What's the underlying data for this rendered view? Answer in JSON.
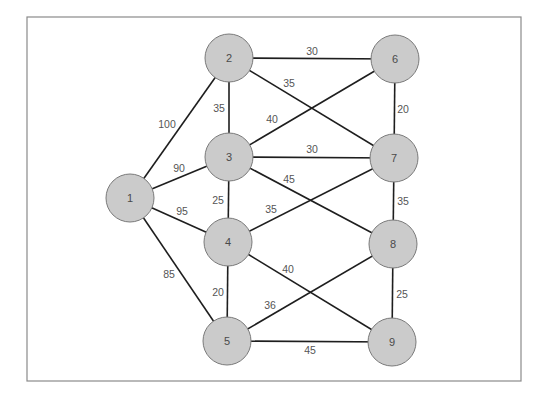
{
  "diagram": {
    "type": "weighted-undirected-graph",
    "colors": {
      "node_fill": "#cbcbcb",
      "node_stroke": "#7a7a7a",
      "edge": "#1e1e1e",
      "label": "#555555",
      "frame": "#8a8a8a"
    },
    "frame": {
      "x": 27,
      "y": 17,
      "w": 494,
      "h": 364
    },
    "nodes": [
      {
        "id": "1",
        "label": "1",
        "x": 130,
        "y": 198
      },
      {
        "id": "2",
        "label": "2",
        "x": 229,
        "y": 58
      },
      {
        "id": "3",
        "label": "3",
        "x": 229,
        "y": 157
      },
      {
        "id": "4",
        "label": "4",
        "x": 228,
        "y": 242
      },
      {
        "id": "5",
        "label": "5",
        "x": 227,
        "y": 341
      },
      {
        "id": "6",
        "label": "6",
        "x": 395,
        "y": 59
      },
      {
        "id": "7",
        "label": "7",
        "x": 394,
        "y": 158
      },
      {
        "id": "8",
        "label": "8",
        "x": 393,
        "y": 244
      },
      {
        "id": "9",
        "label": "9",
        "x": 392,
        "y": 342
      }
    ],
    "node_radius": 24,
    "edges": [
      {
        "from": "1",
        "to": "2",
        "weight": "100",
        "lx": 167,
        "ly": 124
      },
      {
        "from": "1",
        "to": "3",
        "weight": "90",
        "lx": 179,
        "ly": 168
      },
      {
        "from": "1",
        "to": "4",
        "weight": "95",
        "lx": 182,
        "ly": 211
      },
      {
        "from": "1",
        "to": "5",
        "weight": "85",
        "lx": 169,
        "ly": 274
      },
      {
        "from": "2",
        "to": "3",
        "weight": "35",
        "lx": 219,
        "ly": 108
      },
      {
        "from": "2",
        "to": "6",
        "weight": "30",
        "lx": 312,
        "ly": 51
      },
      {
        "from": "2",
        "to": "7",
        "weight": "35",
        "lx": 289,
        "ly": 83
      },
      {
        "from": "3",
        "to": "6",
        "weight": "40",
        "lx": 272,
        "ly": 119
      },
      {
        "from": "3",
        "to": "7",
        "weight": "30",
        "lx": 312,
        "ly": 149
      },
      {
        "from": "3",
        "to": "8",
        "weight": "45",
        "lx": 289,
        "ly": 179
      },
      {
        "from": "3",
        "to": "4",
        "weight": "25",
        "lx": 218,
        "ly": 200
      },
      {
        "from": "4",
        "to": "7",
        "weight": "35",
        "lx": 271,
        "ly": 209
      },
      {
        "from": "4",
        "to": "9",
        "weight": "40",
        "lx": 288,
        "ly": 269
      },
      {
        "from": "4",
        "to": "5",
        "weight": "20",
        "lx": 218,
        "ly": 292
      },
      {
        "from": "5",
        "to": "8",
        "weight": "36",
        "lx": 270,
        "ly": 305
      },
      {
        "from": "5",
        "to": "9",
        "weight": "45",
        "lx": 310,
        "ly": 350
      },
      {
        "from": "6",
        "to": "7",
        "weight": "20",
        "lx": 403,
        "ly": 109
      },
      {
        "from": "7",
        "to": "8",
        "weight": "35",
        "lx": 403,
        "ly": 201
      },
      {
        "from": "8",
        "to": "9",
        "weight": "25",
        "lx": 402,
        "ly": 294
      }
    ]
  }
}
